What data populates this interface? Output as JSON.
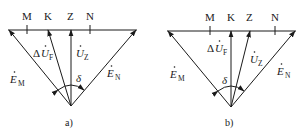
{
  "diagrams": [
    {
      "id": "a",
      "caption": "a)",
      "points": {
        "M": "M",
        "K": "K",
        "Z": "Z",
        "N": "N"
      },
      "vectors": {
        "EM": {
          "base": "E",
          "sub": "M"
        },
        "EN": {
          "base": "E",
          "sub": "N"
        },
        "UF": {
          "prefix": "Δ",
          "base": "U",
          "sub": "F"
        },
        "UZ": {
          "base": "U",
          "sub": "Z"
        }
      },
      "angle": "δ"
    },
    {
      "id": "b",
      "caption": "b)",
      "points": {
        "M": "M",
        "K": "K",
        "Z": "Z",
        "N": "N"
      },
      "vectors": {
        "EM": {
          "base": "E",
          "sub": "M"
        },
        "EN": {
          "base": "E",
          "sub": "N"
        },
        "UF": {
          "prefix": "Δ",
          "base": "U",
          "sub": "F"
        },
        "UZ": {
          "base": "U",
          "sub": "Z"
        }
      },
      "angle": "δ"
    }
  ]
}
